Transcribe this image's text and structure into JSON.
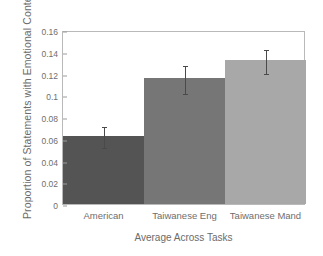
{
  "chart_data": {
    "type": "bar",
    "title": "",
    "xlabel": "Average Across Tasks",
    "ylabel": "Proportion of Statements with Emotional Content",
    "categories": [
      "American",
      "Taiwanese Eng",
      "Taiwanese Mand"
    ],
    "values": [
      0.063,
      0.116,
      0.132
    ],
    "errors": [
      0.01,
      0.013,
      0.011
    ],
    "bar_colors": [
      "#545454",
      "#767676",
      "#a8a8a8"
    ],
    "ylim": [
      0,
      0.16
    ],
    "yticks": [
      0,
      0.02,
      0.04,
      0.06,
      0.08,
      0.1,
      0.12,
      0.14,
      0.16
    ],
    "ytick_labels": [
      "0",
      "0.02",
      "0.04",
      "0.06",
      "0.08",
      "0.1",
      "0.12",
      "0.14",
      "0.16"
    ],
    "grid": false,
    "legend": null,
    "frame_color": "#b9b9b9",
    "error_bar_color": "#4a4a4a",
    "bar_gap": 0
  }
}
